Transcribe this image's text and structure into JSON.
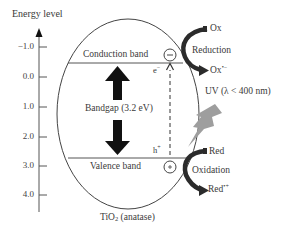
{
  "diagram": {
    "axis_title": "Energy level",
    "ticks": [
      {
        "label": "−1.0",
        "y": 47
      },
      {
        "label": "0.0",
        "y": 77
      },
      {
        "label": "1.0",
        "y": 107
      },
      {
        "label": "2.0",
        "y": 137
      },
      {
        "label": "3.0",
        "y": 166
      },
      {
        "label": "4.0",
        "y": 195
      }
    ],
    "conduction_band": "Conduction band",
    "valence_band": "Valence band",
    "bandgap": "Bandgap (3.2 eV)",
    "electron": "e",
    "electron_sup": "−",
    "hole": "h",
    "hole_sup": "+",
    "minus_symbol": "−",
    "plus_symbol": "+",
    "uv_label": "UV (λ < 400 nm)",
    "reduction": {
      "reactant": "Ox",
      "process": "Reduction",
      "product": "Ox",
      "product_sup": "•−"
    },
    "oxidation": {
      "reactant": "Red",
      "process": "Oxidation",
      "product": "Red",
      "product_sup": "•+"
    },
    "material": "TiO",
    "material_sub": "2",
    "material_suffix": " (anatase)",
    "colors": {
      "line": "#444444",
      "arrow_black": "#111111",
      "arrow_dark": "#2b2b2b",
      "uv_bolt": "#9e9e9e"
    }
  }
}
